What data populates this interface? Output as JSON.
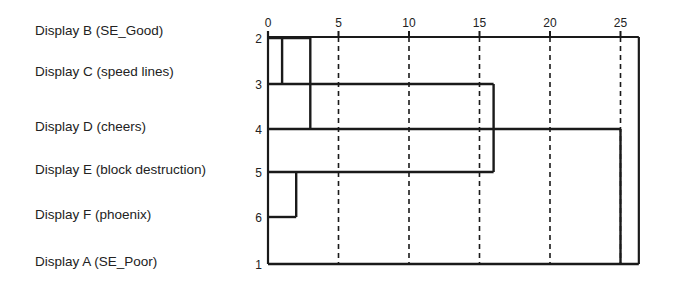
{
  "chart_data": {
    "type": "dendrogram",
    "title": "",
    "xlabel": "",
    "ylabel": "",
    "x_axis": {
      "range": [
        0,
        26.3
      ],
      "ticks": [
        0,
        5,
        10,
        15,
        20,
        25
      ],
      "tick_labels": [
        "0",
        "5",
        "10",
        "15",
        "20",
        "25"
      ],
      "grid": "dashed vertical lines at 5, 10, 15, 20, 25"
    },
    "leaves": [
      {
        "label": "Display B (SE_Good)",
        "case": "2"
      },
      {
        "label": "Display C (speed lines)",
        "case": "3"
      },
      {
        "label": "Display D (cheers)",
        "case": "4"
      },
      {
        "label": "Display E (block destruction)",
        "case": "5"
      },
      {
        "label": "Display F (phoenix)",
        "case": "6"
      },
      {
        "label": "Display A (SE_Poor)",
        "case": "1"
      }
    ],
    "links": [
      {
        "from_row": 0,
        "to_row": 1,
        "distance": 1,
        "join_row": 1
      },
      {
        "from_row": 3,
        "to_row": 4,
        "distance": 2,
        "join_row": 3
      },
      {
        "from_row": 0,
        "to_row": 2,
        "distance": 3,
        "join_row": 2
      },
      {
        "from_row": 1,
        "to_row": 3,
        "distance": 16,
        "join_row": 2
      },
      {
        "from_row": 2,
        "to_row": 5,
        "distance": 25,
        "join_row": 5
      }
    ],
    "row_extents": [
      {
        "row": 0,
        "start": 0,
        "end": 3
      },
      {
        "row": 1,
        "start": 0,
        "end": 16
      },
      {
        "row": 2,
        "start": 0,
        "end": 25
      },
      {
        "row": 3,
        "start": 0,
        "end": 16
      },
      {
        "row": 4,
        "start": 0,
        "end": 2
      },
      {
        "row": 5,
        "start": 0,
        "end": 26.3
      }
    ],
    "frame": {
      "top_row": 0,
      "bottom_row": 5,
      "right": 26.3
    }
  }
}
